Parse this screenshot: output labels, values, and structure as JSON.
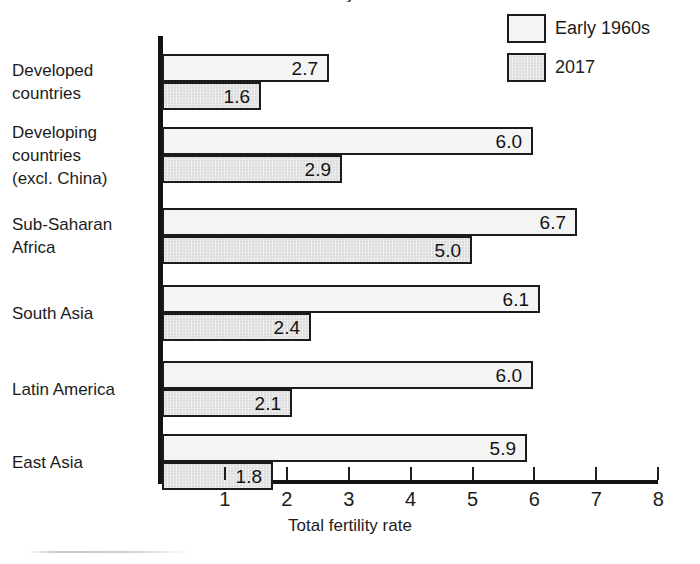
{
  "figure": {
    "background": "#ffffff",
    "clipped_title_fragment": "y",
    "footer_rule_color": "#c9c9c9"
  },
  "legend": {
    "position": "top-right",
    "entries": [
      {
        "label": "Early 1960s",
        "swatch": "light",
        "color": "#f4f4f4"
      },
      {
        "label": "2017",
        "swatch": "grey",
        "color": "#dcdcdc"
      }
    ]
  },
  "axis": {
    "x_title": "Total fertility rate",
    "ticks": [
      "1",
      "2",
      "3",
      "4",
      "5",
      "6",
      "7",
      "8"
    ],
    "tick_values": [
      1,
      2,
      3,
      4,
      5,
      6,
      7,
      8
    ],
    "x_min": 0,
    "x_max": 8,
    "axis_color": "#141414"
  },
  "chart_data": {
    "type": "bar",
    "orientation": "horizontal",
    "title": "",
    "xlabel": "Total fertility rate",
    "ylabel": "",
    "xlim": [
      0,
      8
    ],
    "grid": false,
    "legend_position": "top-right",
    "categories": [
      "Developed countries",
      "Developing countries (excl. China)",
      "Sub-Saharan Africa",
      "South Asia",
      "Latin America",
      "East Asia"
    ],
    "category_lines": [
      [
        "Developed",
        "countries"
      ],
      [
        "Developing",
        "countries",
        "(excl. China)"
      ],
      [
        "Sub-Saharan",
        "Africa"
      ],
      [
        "South Asia"
      ],
      [
        "Latin America"
      ],
      [
        "East Asia"
      ]
    ],
    "series": [
      {
        "name": "Early 1960s",
        "color": "#f4f4f4",
        "values": [
          2.7,
          6.0,
          6.7,
          6.1,
          6.0,
          5.9
        ],
        "labels": [
          "2.7",
          "6.0",
          "6.7",
          "6.1",
          "6.0",
          "5.9"
        ]
      },
      {
        "name": "2017",
        "color": "#dcdcdc",
        "values": [
          1.6,
          2.9,
          5.0,
          2.4,
          2.1,
          1.8
        ],
        "labels": [
          "1.6",
          "2.9",
          "5.0",
          "2.4",
          "2.1",
          "1.8"
        ]
      }
    ]
  }
}
